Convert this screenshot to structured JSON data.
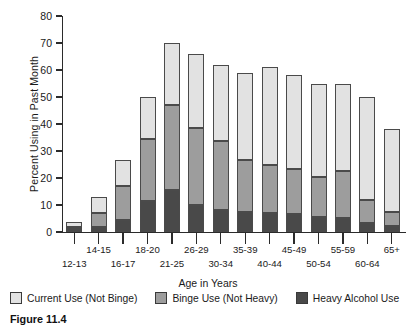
{
  "figure": {
    "caption": "Figure 11.4"
  },
  "chart_data": {
    "type": "bar",
    "subtype": "stacked-vertical",
    "title": "",
    "xlabel": "Age in Years",
    "ylabel": "Percent Using in Past Month",
    "ylim": [
      0,
      80
    ],
    "yticks": [
      0,
      10,
      20,
      30,
      40,
      50,
      60,
      70,
      80
    ],
    "ytick_labels": [
      "0",
      "10",
      "20",
      "30",
      "40",
      "50",
      "60",
      "70",
      "80"
    ],
    "grid": false,
    "legend_position": "bottom",
    "categories": [
      "12-13",
      "14-15",
      "16-17",
      "18-20",
      "21-25",
      "26-29",
      "30-34",
      "35-39",
      "40-44",
      "45-49",
      "50-54",
      "55-59",
      "60-64",
      "65+"
    ],
    "series": [
      {
        "name": "Heavy Alcohol Use",
        "color": "#494949",
        "values": [
          1.0,
          2.0,
          4.5,
          11.5,
          15.6,
          10.0,
          8.0,
          7.3,
          7.0,
          6.5,
          5.6,
          5.3,
          3.3,
          2.4
        ]
      },
      {
        "name": "Binge Use (Not Heavy)",
        "color": "#9d9d9d",
        "values": [
          1.0,
          5.0,
          12.5,
          23.0,
          31.4,
          28.6,
          25.7,
          19.4,
          17.8,
          16.9,
          14.9,
          17.4,
          8.4,
          4.9
        ]
      },
      {
        "name": "Current Use (Not Binge)",
        "color": "#e2e2e2",
        "values": [
          1.6,
          6.0,
          9.5,
          15.5,
          23.0,
          27.4,
          28.3,
          32.3,
          36.2,
          34.6,
          34.5,
          32.3,
          38.3,
          31.0
        ]
      }
    ],
    "totals": [
      3.6,
      13.0,
      26.5,
      50.0,
      70.0,
      66.0,
      62.0,
      59.0,
      61.0,
      58.0,
      55.0,
      55.0,
      50.0,
      38.3
    ],
    "annotations": []
  },
  "legend": {
    "items": [
      {
        "label": "Current Use (Not Binge)",
        "color": "#e2e2e2"
      },
      {
        "label": "Binge Use (Not Heavy)",
        "color": "#9d9d9d"
      },
      {
        "label": "Heavy Alcohol Use",
        "color": "#494949"
      }
    ]
  }
}
